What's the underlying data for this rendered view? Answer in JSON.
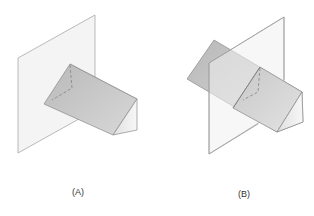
{
  "figure": {
    "panels": [
      {
        "id": "A",
        "label": "(A)",
        "description": "Triangular prism passing through (in front of) a vertical plane; hidden edges of prism end shown dashed behind plane"
      },
      {
        "id": "B",
        "label": "(B)",
        "description": "Triangular prism intersecting a vertical plane midway; hidden edges shown dashed at intersection"
      }
    ]
  },
  "colors": {
    "plane_fill": "#f4f4f4",
    "plane_stroke": "#a8a8a8",
    "prism_top_face": "#c4c4c4",
    "prism_front_face": "#d2d2d2",
    "prism_end_face": "#ececec",
    "edge_stroke": "#8a8a8a",
    "hidden_line": "#808080",
    "label_color": "#333333"
  }
}
